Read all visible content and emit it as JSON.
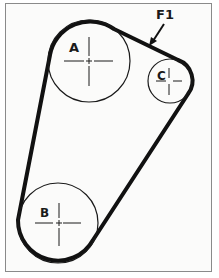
{
  "diagram": {
    "type": "belt-routing",
    "callout": {
      "label": "F1",
      "x": 163,
      "y": 19
    },
    "pulleys": [
      {
        "id": "A",
        "label": "A",
        "cx": 89,
        "cy": 61,
        "r": 41
      },
      {
        "id": "B",
        "label": "B",
        "cx": 58,
        "cy": 223,
        "r": 40
      },
      {
        "id": "C",
        "label": "C",
        "cx": 170,
        "cy": 81,
        "r": 22
      }
    ],
    "colors": {
      "belt": "#111111",
      "pulley_outline": "#1a1a1a",
      "frame_border": "#8a8a8a",
      "background": "#fbfbfa"
    }
  }
}
